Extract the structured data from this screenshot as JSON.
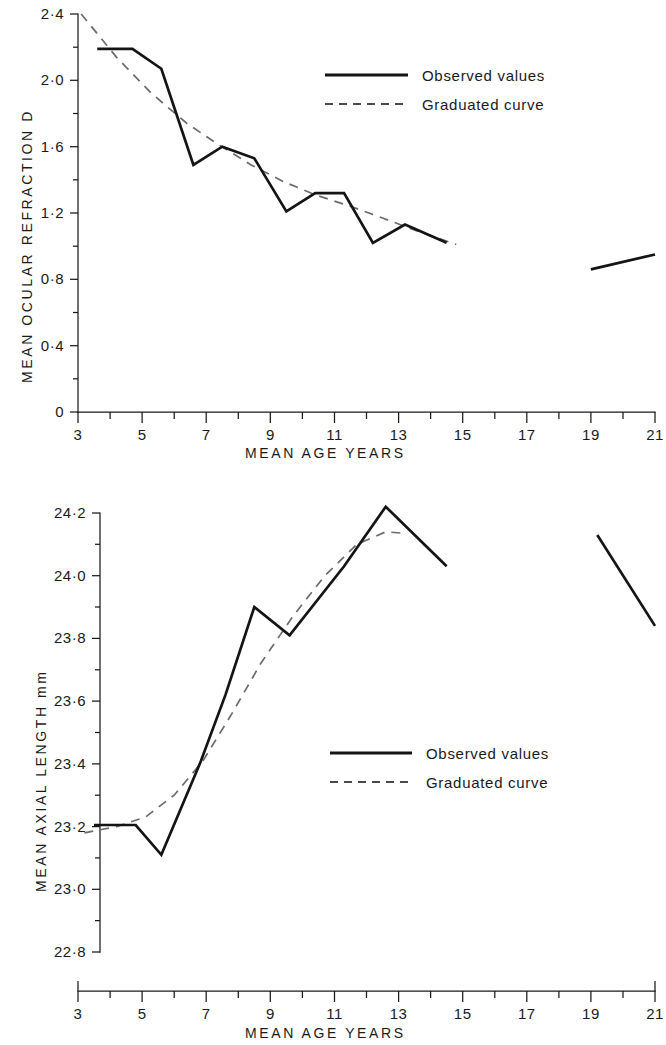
{
  "figure": {
    "panels": [
      {
        "id": "top",
        "y_axis_title": "MEAN OCULAR REFRACTION  D",
        "x_axis_title": "MEAN  AGE  YEARS",
        "y_tick_labels": [
          "0",
          "0·4",
          "0·8",
          "1·2",
          "1·6",
          "2·0",
          "2·4"
        ],
        "x_tick_labels": [
          "3",
          "5",
          "7",
          "9",
          "11",
          "13",
          "15",
          "17",
          "19",
          "21"
        ],
        "legend": {
          "observed": "Observed values",
          "graduated": "Graduated curve"
        }
      },
      {
        "id": "bottom",
        "y_axis_title": "MEAN  AXIAL  LENGTH  mm",
        "x_axis_title": "MEAN  AGE  YEARS",
        "y_tick_labels": [
          "22·8",
          "23·0",
          "23·2",
          "23·4",
          "23·6",
          "23·8",
          "24·0",
          "24·2"
        ],
        "x_tick_labels": [
          "3",
          "5",
          "7",
          "9",
          "11",
          "13",
          "15",
          "17",
          "19",
          "21"
        ],
        "legend": {
          "observed": "Observed values",
          "graduated": "Graduated curve"
        }
      }
    ]
  },
  "chart_data": [
    {
      "type": "line",
      "id": "mean-ocular-refraction-vs-age",
      "title": "",
      "xlabel": "MEAN  AGE  YEARS",
      "ylabel": "MEAN OCULAR REFRACTION  D",
      "xlim": [
        3,
        21
      ],
      "ylim": [
        0,
        2.4
      ],
      "yticks": [
        0,
        0.4,
        0.8,
        1.2,
        1.6,
        2.0,
        2.4
      ],
      "yticks_minor": [
        0.2,
        0.6,
        1.0,
        1.4,
        1.8,
        2.2
      ],
      "xticks": [
        3,
        5,
        7,
        9,
        11,
        13,
        15,
        17,
        19,
        21
      ],
      "xticks_minor": [
        4,
        6,
        8,
        10,
        12,
        14,
        16,
        18,
        20
      ],
      "grid": false,
      "legend_position": "upper-right-inside",
      "series": [
        {
          "name": "Observed values",
          "style": "solid",
          "color": "#141414",
          "segments": [
            {
              "x": [
                3.6,
                4.7,
                5.6,
                6.6,
                7.5,
                8.5,
                9.5,
                10.4,
                11.3,
                12.2,
                13.2,
                14.5
              ],
              "y": [
                2.19,
                2.19,
                2.07,
                1.49,
                1.6,
                1.53,
                1.21,
                1.32,
                1.32,
                1.02,
                1.13,
                1.02
              ]
            },
            {
              "x": [
                19.0,
                21.0
              ],
              "y": [
                0.86,
                0.95
              ]
            }
          ]
        },
        {
          "name": "Graduated curve",
          "style": "dashed",
          "color": "#6b6b6b",
          "segments": [
            {
              "x": [
                3.1,
                4.2,
                5.3,
                6.4,
                7.4,
                8.4,
                9.4,
                10.4,
                11.5,
                12.5,
                13.6,
                14.8
              ],
              "y": [
                2.4,
                2.14,
                1.92,
                1.74,
                1.61,
                1.49,
                1.39,
                1.31,
                1.24,
                1.17,
                1.09,
                1.01
              ]
            }
          ]
        }
      ]
    },
    {
      "type": "line",
      "id": "mean-axial-length-vs-age",
      "title": "",
      "xlabel": "MEAN  AGE  YEARS",
      "ylabel": "MEAN  AXIAL  LENGTH  mm",
      "xlim": [
        3,
        21
      ],
      "ylim": [
        22.8,
        24.2
      ],
      "yticks": [
        22.8,
        23.0,
        23.2,
        23.4,
        23.6,
        23.8,
        24.0,
        24.2
      ],
      "yticks_minor": [
        22.9,
        23.1,
        23.3,
        23.5,
        23.7,
        23.9,
        24.1
      ],
      "xticks": [
        3,
        5,
        7,
        9,
        11,
        13,
        15,
        17,
        19,
        21
      ],
      "xticks_minor": [
        4,
        6,
        8,
        10,
        12,
        14,
        16,
        18,
        20
      ],
      "grid": false,
      "legend_position": "center-right-inside",
      "series": [
        {
          "name": "Observed values",
          "style": "solid",
          "color": "#141414",
          "segments": [
            {
              "x": [
                3.5,
                4.8,
                5.6,
                6.8,
                7.6,
                8.5,
                9.6,
                11.3,
                12.6,
                14.5
              ],
              "y": [
                23.205,
                23.205,
                23.11,
                23.4,
                23.62,
                23.9,
                23.81,
                24.03,
                24.22,
                24.03
              ]
            },
            {
              "x": [
                19.2,
                21.0
              ],
              "y": [
                24.13,
                23.84
              ]
            }
          ]
        },
        {
          "name": "Graduated curve",
          "style": "dashed",
          "color": "#6b6b6b",
          "segments": [
            {
              "x": [
                3.2,
                4.2,
                5.1,
                6.0,
                6.9,
                7.8,
                8.7,
                9.7,
                10.7,
                11.7,
                12.6,
                13.2
              ],
              "y": [
                23.18,
                23.2,
                23.23,
                23.3,
                23.41,
                23.56,
                23.72,
                23.87,
                24.0,
                24.1,
                24.14,
                24.135
              ]
            }
          ]
        }
      ]
    }
  ]
}
